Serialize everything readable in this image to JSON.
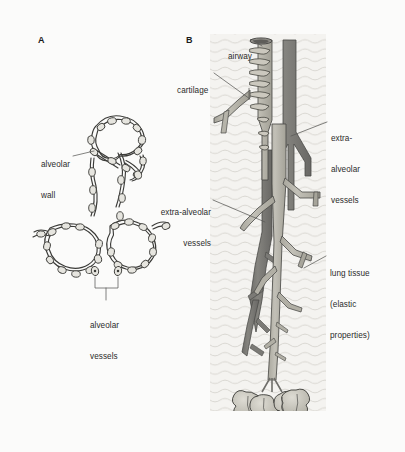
{
  "figure": {
    "background_color": "#fbfbfa",
    "panels": [
      {
        "id": "A",
        "letter": "A",
        "caption": "alveolar wall cross-section with capillaries"
      },
      {
        "id": "B",
        "letter": "B",
        "caption": "airway and vessel tree within lung tissue"
      }
    ]
  },
  "panel_a": {
    "letter": "A",
    "labels": {
      "alveolar_wall": {
        "lines": [
          "alveolar",
          "wall"
        ],
        "align": "left"
      },
      "alveolar_vessels": {
        "lines": [
          "alveolar",
          "vessels"
        ],
        "align": "left"
      }
    }
  },
  "panel_b": {
    "letter": "B",
    "labels": {
      "airway": {
        "lines": [
          "airway"
        ],
        "align": "left"
      },
      "cartilage": {
        "lines": [
          "cartilage"
        ],
        "align": "left"
      },
      "extra_alveolar_vessels_right": {
        "lines": [
          "extra-",
          "alveolar",
          "vessels"
        ],
        "align": "left"
      },
      "extra_alveolar_vessels_left": {
        "lines": [
          "extra-alveolar",
          "vessels"
        ],
        "align": "right"
      },
      "lung_tissue": {
        "lines": [
          "lung tissue",
          "(elastic",
          "properties)"
        ],
        "align": "left"
      }
    }
  },
  "colors": {
    "page_background": "#fbfbfa",
    "tissue_texture_panel": "#f4f3f0",
    "tissue_wave_line": "#cfcdc6",
    "dark_vessel": "#7d7c78",
    "light_vessel": "#b4b2a8",
    "airway_wall": "#b9b6ac",
    "cartilage_ring": "#c8c5bb",
    "alveolar_sac": "#c3c1b8",
    "outline": "#3a3a38",
    "capillary_fill": "#e3e2dc",
    "leader_line": "#555553",
    "text": "#2b2b2b"
  },
  "icons": {
    "leader_line": "leader-line-icon",
    "bracket": "bracket-icon"
  }
}
